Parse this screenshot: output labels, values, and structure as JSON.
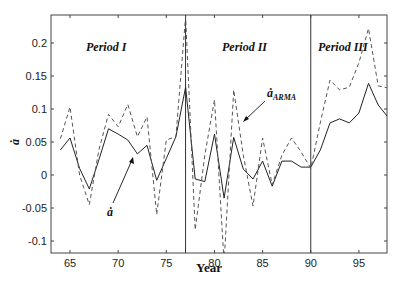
{
  "chart_data": {
    "type": "line",
    "title": "",
    "xlabel": "Year",
    "ylabel": "ȧ",
    "xlim": [
      63.5,
      98
    ],
    "ylim": [
      -0.115,
      0.242
    ],
    "xticks": [
      65,
      70,
      75,
      80,
      85,
      90,
      95
    ],
    "yticks": [
      -0.1,
      -0.05,
      0,
      0.05,
      0.1,
      0.15,
      0.2
    ],
    "ytick_labels": [
      "-0.1",
      "-0.05",
      "0",
      "0.05",
      "0.1",
      "0.15",
      "0.2"
    ],
    "grid": false,
    "legend": null,
    "x": [
      64,
      65,
      66,
      67,
      68,
      69,
      70,
      71,
      72,
      73,
      74,
      75,
      76,
      77,
      78,
      79,
      80,
      81,
      82,
      83,
      84,
      85,
      86,
      87,
      88,
      89,
      90,
      91,
      92,
      93,
      94,
      95,
      96,
      97,
      98
    ],
    "series": [
      {
        "name": "ȧ",
        "style": "solid",
        "values": [
          0.038,
          0.056,
          0.01,
          -0.021,
          0.023,
          0.07,
          0.062,
          0.053,
          0.032,
          0.045,
          -0.008,
          0.025,
          0.058,
          0.133,
          -0.006,
          -0.01,
          0.062,
          -0.035,
          0.057,
          0.009,
          -0.006,
          0.021,
          -0.017,
          0.021,
          0.021,
          0.012,
          0.012,
          0.038,
          0.079,
          0.085,
          0.079,
          0.094,
          0.139,
          0.106,
          0.088
        ]
      },
      {
        "name": "ȧ_ARMA",
        "style": "dashed",
        "values": [
          0.055,
          0.103,
          0.0,
          -0.045,
          0.038,
          0.092,
          0.073,
          0.107,
          0.058,
          0.088,
          -0.06,
          0.053,
          0.058,
          0.24,
          -0.083,
          0.03,
          0.114,
          -0.133,
          0.129,
          0.03,
          -0.047,
          0.056,
          -0.015,
          0.03,
          0.056,
          0.035,
          0.01,
          0.08,
          0.144,
          0.129,
          0.133,
          0.17,
          0.222,
          0.135,
          0.132
        ]
      }
    ],
    "vertical_lines": [
      77,
      90
    ],
    "annotations": [
      {
        "text": "Period I",
        "x": 68.5,
        "y": 0.2
      },
      {
        "text": "Period II",
        "x": 81.5,
        "y": 0.2
      },
      {
        "text": "Period III",
        "x": 93,
        "y": 0.2
      },
      {
        "text": "ȧ_ARMA",
        "arrow_to": [
          82.9,
          0.08
        ]
      },
      {
        "text": "ȧ",
        "arrow_to": [
          71.6,
          0.027
        ]
      }
    ]
  },
  "labels": {
    "period1": "Period I",
    "period2": "Period II",
    "period3": "Period III",
    "annot_arma_main": "ȧ",
    "annot_arma_sub": "ARMA",
    "annot_a": "ȧ",
    "xlabel": "Year",
    "ylabel": "ȧ"
  }
}
